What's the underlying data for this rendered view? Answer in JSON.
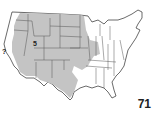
{
  "caption": "",
  "map": {
    "title": "Range map of the contiguous United States",
    "range_color": "#c4c4c4",
    "land_color": "#ffffff",
    "border_color": "#555555",
    "markers": [
      {
        "label": "5",
        "state": "Utah",
        "x": 34,
        "y": 43
      },
      {
        "label": "?",
        "state": "California",
        "x": 3,
        "y": 51
      }
    ],
    "shaded_states": [
      "Washington (east)",
      "Oregon (east)",
      "Idaho",
      "Montana",
      "Wyoming",
      "North Dakota",
      "South Dakota",
      "Nebraska",
      "Kansas",
      "Colorado",
      "Utah",
      "Nevada",
      "Arizona",
      "New Mexico",
      "Texas (west)",
      "Oklahoma (west)",
      "Iowa",
      "Minnesota (west)",
      "Illinois (part)",
      "California (south-east)"
    ]
  },
  "page_number": "71"
}
